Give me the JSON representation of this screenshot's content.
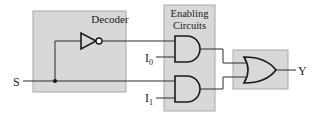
{
  "diagram": {
    "type": "logic-circuit",
    "colors": {
      "block_fill": "#d8d8d8",
      "block_border": "#a8a8a8",
      "wire": "#2a2a2a"
    },
    "blocks": {
      "decoder": {
        "label": "Decoder"
      },
      "enabling": {
        "label_line1": "Enabling",
        "label_line2": "Circuits"
      },
      "or_block": {
        "label": ""
      }
    },
    "signals": {
      "select": "S",
      "input0_base": "I",
      "input0_sub": "0",
      "input1_base": "I",
      "input1_sub": "1",
      "output": "Y"
    },
    "gates": [
      {
        "id": "not",
        "type": "NOT",
        "block": "decoder"
      },
      {
        "id": "and0",
        "type": "AND",
        "block": "enabling"
      },
      {
        "id": "and1",
        "type": "AND",
        "block": "enabling"
      },
      {
        "id": "or",
        "type": "OR",
        "block": "or_block"
      }
    ]
  }
}
